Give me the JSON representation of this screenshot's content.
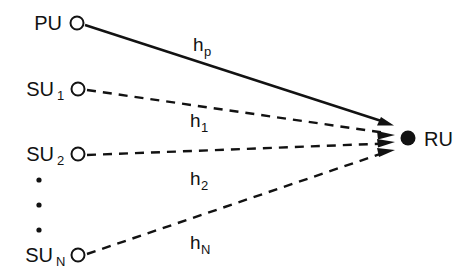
{
  "figure": {
    "type": "network-diagram",
    "background_color": "#ffffff",
    "stroke_color": "#121212",
    "width": 468,
    "height": 276
  },
  "nodes": {
    "primary_user": {
      "id": "PU",
      "label": "PU",
      "subscript": "",
      "marker": "open-circle",
      "cx": 77,
      "cy": 23,
      "r": 6.5,
      "label_x": 62,
      "label_y": 30
    },
    "secondary_user_1": {
      "id": "SU1",
      "label": "SU",
      "subscript": "1",
      "marker": "open-circle",
      "cx": 78,
      "cy": 89,
      "r": 6.5,
      "label_x": 58,
      "label_y": 96,
      "sub_x": 59,
      "sub_y": 100
    },
    "secondary_user_2": {
      "id": "SU2",
      "label": "SU",
      "subscript": "2",
      "marker": "open-circle",
      "cx": 78,
      "cy": 154,
      "r": 6.5,
      "label_x": 58,
      "label_y": 161,
      "sub_x": 59,
      "sub_y": 165
    },
    "secondary_user_n": {
      "id": "SUN",
      "label": "SU",
      "subscript": "N",
      "marker": "open-circle",
      "cx": 78,
      "cy": 255,
      "r": 6.5,
      "label_x": 57,
      "label_y": 262,
      "sub_x": 58,
      "sub_y": 266
    },
    "receiver_unit": {
      "id": "RU",
      "label": "RU",
      "subscript": "",
      "marker": "filled-circle",
      "cx": 408,
      "cy": 138,
      "r": 7.5,
      "label_x": 425,
      "label_y": 146
    }
  },
  "ellipsis": {
    "name": "vertical-ellipsis",
    "x": 39,
    "dots": [
      180,
      205,
      230
    ],
    "radius": 2.6
  },
  "links": [
    {
      "id": "h_p",
      "from": "PU",
      "to": "RU",
      "style": "solid",
      "label": "h",
      "subscript": "p",
      "x1": 85,
      "y1": 25,
      "x2": 391,
      "y2": 124,
      "label_x": 193,
      "label_y": 50,
      "sub_x": 204,
      "sub_y": 55
    },
    {
      "id": "h_1",
      "from": "SU1",
      "to": "RU",
      "style": "dashed",
      "label": "h",
      "subscript": "1",
      "x1": 87,
      "y1": 90,
      "x2": 391,
      "y2": 134,
      "label_x": 190,
      "label_y": 126,
      "sub_x": 201,
      "sub_y": 131
    },
    {
      "id": "h_2",
      "from": "SU2",
      "to": "RU",
      "style": "dashed",
      "label": "h",
      "subscript": "2",
      "x1": 87,
      "y1": 155,
      "x2": 391,
      "y2": 143,
      "label_x": 190,
      "label_y": 184,
      "sub_x": 201,
      "sub_y": 189
    },
    {
      "id": "h_N",
      "from": "SUN",
      "to": "RU",
      "style": "dashed",
      "label": "h",
      "subscript": "N",
      "x1": 87,
      "y1": 254,
      "x2": 391,
      "y2": 152,
      "label_x": 190,
      "label_y": 248,
      "sub_x": 201,
      "sub_y": 253
    }
  ]
}
